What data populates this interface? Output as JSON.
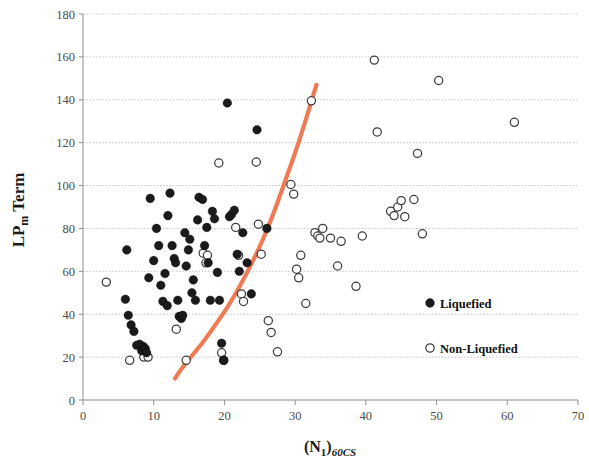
{
  "chart_data": {
    "type": "scatter",
    "title": "",
    "xlabel": "(N1)60CS",
    "xlabel_parts": {
      "base": "(N",
      "base_sub": "1",
      "close": ")",
      "sub_italic": "60CS"
    },
    "ylabel": "LPm Term",
    "ylabel_parts": {
      "base": "LP",
      "sub": "m",
      "rest": " Term"
    },
    "xlim": [
      0,
      70
    ],
    "ylim": [
      0,
      180
    ],
    "xticks": [
      0,
      10,
      20,
      30,
      40,
      50,
      60,
      70
    ],
    "yticks": [
      0,
      20,
      40,
      60,
      80,
      100,
      120,
      140,
      160,
      180
    ],
    "grid": "horizontal",
    "legend_position": "inside-right",
    "series": [
      {
        "name": "Liquefied",
        "marker": "filled-circle",
        "color": "#1b1b1b",
        "points": [
          [
            6.2,
            70
          ],
          [
            6.0,
            47
          ],
          [
            6.4,
            39.5
          ],
          [
            6.8,
            35
          ],
          [
            7.2,
            32
          ],
          [
            7.6,
            25.5
          ],
          [
            8.0,
            26
          ],
          [
            8.3,
            23
          ],
          [
            8.5,
            25
          ],
          [
            8.8,
            24
          ],
          [
            9.0,
            22
          ],
          [
            9.3,
            57
          ],
          [
            9.5,
            94
          ],
          [
            10.0,
            65
          ],
          [
            10.4,
            80
          ],
          [
            10.7,
            72
          ],
          [
            11.0,
            53.5
          ],
          [
            11.3,
            46
          ],
          [
            11.6,
            59
          ],
          [
            11.9,
            44
          ],
          [
            12.3,
            96.5
          ],
          [
            12.6,
            72
          ],
          [
            12.9,
            66
          ],
          [
            13.1,
            64
          ],
          [
            13.4,
            46.5
          ],
          [
            13.6,
            39
          ],
          [
            13.9,
            38
          ],
          [
            14.1,
            39.5
          ],
          [
            14.4,
            78
          ],
          [
            14.6,
            62.5
          ],
          [
            14.9,
            70
          ],
          [
            15.1,
            75
          ],
          [
            15.4,
            50
          ],
          [
            15.6,
            56
          ],
          [
            15.9,
            46.5
          ],
          [
            16.2,
            84
          ],
          [
            16.4,
            94.5
          ],
          [
            16.9,
            93.5
          ],
          [
            17.2,
            72
          ],
          [
            17.5,
            80.5
          ],
          [
            17.7,
            64
          ],
          [
            18.0,
            46.5
          ],
          [
            18.3,
            88
          ],
          [
            18.6,
            84.5
          ],
          [
            19.0,
            59.5
          ],
          [
            19.3,
            46.5
          ],
          [
            19.6,
            26.5
          ],
          [
            19.9,
            18.5
          ],
          [
            20.4,
            138.5
          ],
          [
            20.7,
            85.5
          ],
          [
            21.0,
            86.5
          ],
          [
            21.4,
            88.5
          ],
          [
            21.8,
            68
          ],
          [
            22.1,
            60
          ],
          [
            22.6,
            78
          ],
          [
            23.2,
            64
          ],
          [
            23.8,
            49.5
          ],
          [
            24.6,
            126
          ],
          [
            26.0,
            80
          ],
          [
            12.0,
            86
          ]
        ]
      },
      {
        "name": "Non-Liquefied",
        "marker": "open-circle",
        "color": "#3d3d3d",
        "points": [
          [
            3.3,
            55
          ],
          [
            6.6,
            18.5
          ],
          [
            8.6,
            20
          ],
          [
            9.2,
            20
          ],
          [
            13.2,
            33
          ],
          [
            14.6,
            18.5
          ],
          [
            17.0,
            68.5
          ],
          [
            17.4,
            64
          ],
          [
            17.6,
            67.5
          ],
          [
            19.2,
            110.5
          ],
          [
            19.6,
            22
          ],
          [
            19.9,
            18.5
          ],
          [
            21.6,
            80.5
          ],
          [
            22.0,
            67.5
          ],
          [
            22.4,
            49.5
          ],
          [
            22.7,
            46
          ],
          [
            24.5,
            111
          ],
          [
            24.8,
            82
          ],
          [
            25.2,
            68
          ],
          [
            26.2,
            37
          ],
          [
            26.6,
            31.5
          ],
          [
            27.5,
            22.5
          ],
          [
            29.4,
            100.5
          ],
          [
            29.8,
            96
          ],
          [
            30.2,
            61
          ],
          [
            30.5,
            57
          ],
          [
            30.8,
            67.5
          ],
          [
            31.5,
            45
          ],
          [
            32.3,
            139.5
          ],
          [
            32.8,
            78
          ],
          [
            33.2,
            76.5
          ],
          [
            33.5,
            75.5
          ],
          [
            33.9,
            80
          ],
          [
            35.0,
            75.5
          ],
          [
            36.0,
            62.5
          ],
          [
            36.5,
            74
          ],
          [
            38.6,
            53
          ],
          [
            39.5,
            76.5
          ],
          [
            41.2,
            158.5
          ],
          [
            41.6,
            125
          ],
          [
            43.5,
            88
          ],
          [
            44.0,
            86
          ],
          [
            44.5,
            90
          ],
          [
            45.0,
            93
          ],
          [
            45.5,
            85.5
          ],
          [
            46.8,
            93.5
          ],
          [
            47.3,
            115
          ],
          [
            48.0,
            77.5
          ],
          [
            50.3,
            149
          ],
          [
            61.0,
            129.5
          ]
        ]
      }
    ],
    "boundary_curve": {
      "name": "liquefaction-boundary",
      "color": "#ef7b55",
      "points": [
        [
          13.0,
          10
        ],
        [
          14.0,
          15
        ],
        [
          15.5,
          21
        ],
        [
          17.0,
          27
        ],
        [
          18.5,
          34
        ],
        [
          20.0,
          41
        ],
        [
          21.5,
          49
        ],
        [
          23.0,
          58
        ],
        [
          24.5,
          68
        ],
        [
          26.0,
          79
        ],
        [
          27.5,
          92
        ],
        [
          29.0,
          106
        ],
        [
          30.5,
          120
        ],
        [
          32.0,
          136
        ],
        [
          33.0,
          147
        ]
      ]
    },
    "legend": [
      {
        "label": "Liquefied",
        "marker": "filled-circle"
      },
      {
        "label": "Non-Liquefied",
        "marker": "open-circle"
      }
    ]
  }
}
